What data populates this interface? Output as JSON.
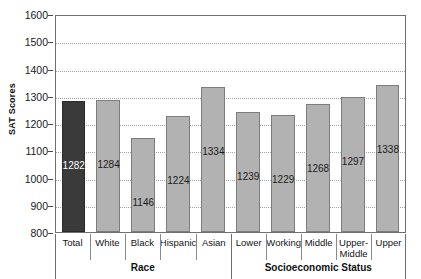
{
  "chart_data": {
    "type": "bar",
    "title": "",
    "xlabel": "",
    "ylabel": "SAT Scores",
    "ylim": [
      800,
      1600
    ],
    "ytick_step": 100,
    "yticks": [
      1600,
      1500,
      1400,
      1300,
      1200,
      1100,
      1000,
      900,
      800
    ],
    "grid": true,
    "legend": "none",
    "categories": [
      "Total",
      "White",
      "Black",
      "Hispanic",
      "Asian",
      "Lower",
      "Working",
      "Middle",
      "Upper-Middle",
      "Upper"
    ],
    "values": [
      1282,
      1284,
      1146,
      1224,
      1334,
      1239,
      1229,
      1268,
      1297,
      1338
    ],
    "bar_styles": [
      "dark",
      "light",
      "light",
      "light",
      "light",
      "light",
      "light",
      "light",
      "light",
      "light"
    ],
    "groups": [
      {
        "label": "Race",
        "span": 5
      },
      {
        "label": "Socioeconomic Status",
        "span": 5
      }
    ],
    "colors": {
      "dark_bar": "#3a3a3a",
      "light_bar": "#b2b2b2",
      "bar_outline": "#7d7d7d",
      "gridline": "#9aa6b4",
      "axis": "#6f6f6f",
      "text": "#141414",
      "dark_bar_label": "#ffffff"
    }
  }
}
